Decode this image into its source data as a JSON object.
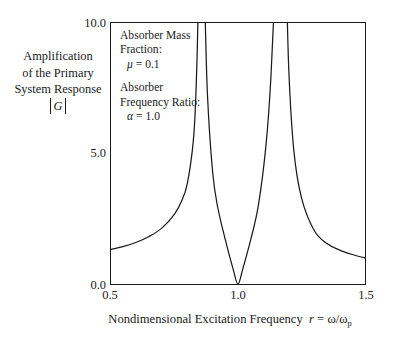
{
  "chart_data": {
    "type": "line",
    "title": "",
    "xlabel": "Nondimensional Excitation Frequency  r = ω/ωp",
    "ylabel": "Amplification of the Primary System Response |G|",
    "xlim": [
      0.5,
      1.5
    ],
    "ylim": [
      0.0,
      10.0
    ],
    "xticks": [
      "0.5",
      "1.0",
      "1.5"
    ],
    "xtick_values": [
      0.5,
      1.0,
      1.5
    ],
    "yticks": [
      "0.0",
      "5.0",
      "10.0"
    ],
    "ytick_values": [
      0.0,
      5.0,
      10.0
    ],
    "grid": false,
    "legend": "none",
    "series": [
      {
        "name": "|G|",
        "comment": "Undamped vibration absorber amplification; poles near r=0.854 and r=1.171, zero at r=1.0",
        "x": [
          0.5,
          0.55,
          0.6,
          0.65,
          0.7,
          0.75,
          0.78,
          0.8,
          0.82,
          0.83,
          0.84,
          0.845,
          0.85,
          0.855,
          0.86,
          0.87,
          0.88,
          0.9,
          0.92,
          0.95,
          0.98,
          1.0,
          1.02,
          1.05,
          1.08,
          1.11,
          1.13,
          1.15,
          1.16,
          1.165,
          1.17,
          1.175,
          1.18,
          1.19,
          1.2,
          1.22,
          1.25,
          1.3,
          1.35,
          1.4,
          1.45,
          1.5
        ],
        "y": [
          1.33,
          1.44,
          1.6,
          1.82,
          2.14,
          2.68,
          3.22,
          3.83,
          5.1,
          6.3,
          9.1,
          12.0,
          19.0,
          40.0,
          24.0,
          10.5,
          7.2,
          4.3,
          2.95,
          1.7,
          0.6,
          0.0,
          0.62,
          1.7,
          3.0,
          5.3,
          8.0,
          14.5,
          25.0,
          45.0,
          60.0,
          38.0,
          22.0,
          12.0,
          8.2,
          5.1,
          3.3,
          2.05,
          1.55,
          1.3,
          1.13,
          1.0
        ]
      }
    ],
    "annotations": [
      {
        "name": "absorber-mass-fraction",
        "lines": [
          "Absorber Mass",
          "Fraction:"
        ],
        "symbol": "μ",
        "equals": "= 0.1",
        "value": 0.1
      },
      {
        "name": "absorber-frequency-ratio",
        "lines": [
          "Absorber",
          "Frequency Ratio:"
        ],
        "symbol": "α",
        "equals": "= 1.0",
        "value": 1.0
      }
    ]
  },
  "axes": {
    "y_title_line1": "Amplification",
    "y_title_line2": "of the Primary",
    "y_title_line3": "System Response",
    "y_title_symbol": "G",
    "x_title_text": "Nondimensional Excitation Frequency",
    "x_title_var": "r",
    "x_title_eq": "=",
    "x_title_ratio_num": "ω",
    "x_title_slash": "/",
    "x_title_ratio_den": "ω",
    "x_title_subscript": "p",
    "ytick_0": "0.0",
    "ytick_1": "5.0",
    "ytick_2": "10.0",
    "xtick_0": "0.5",
    "xtick_1": "1.0",
    "xtick_2": "1.5"
  },
  "annotation": {
    "mass_line1": "Absorber Mass",
    "mass_line2": "Fraction:",
    "mass_symbol": "μ",
    "mass_value": "= 0.1",
    "freq_line1": "Absorber",
    "freq_line2": "Frequency Ratio:",
    "freq_symbol": "α",
    "freq_value": "= 1.0"
  },
  "colors": {
    "curve": "#1a1a1a",
    "axis": "#1a1a1a",
    "background": "#ffffff"
  }
}
